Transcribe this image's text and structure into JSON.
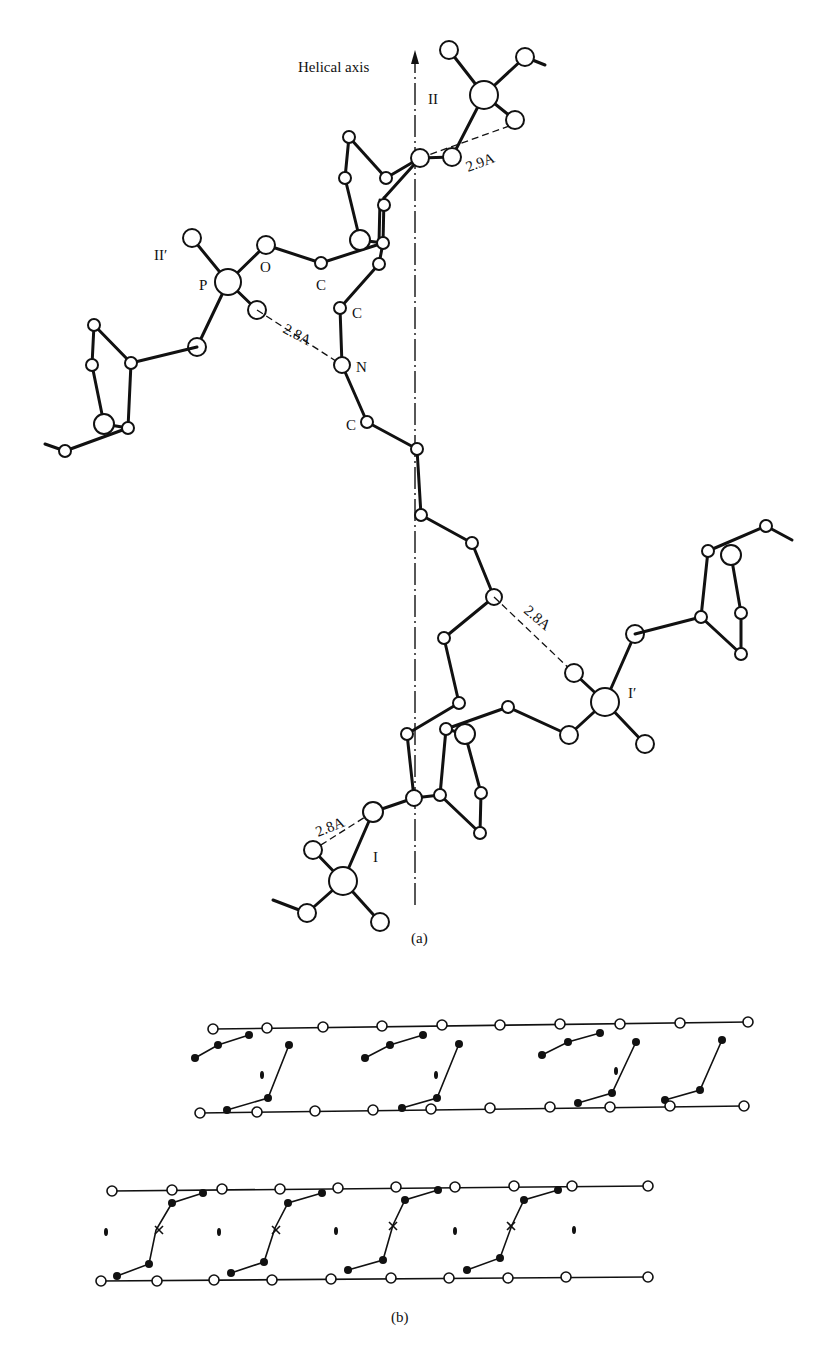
{
  "figure_a": {
    "caption": "(a)",
    "axis_label": "Helical axis",
    "labels": {
      "II": "II",
      "II_prime": "II′",
      "I": "I",
      "I_prime": "I′",
      "P": "P",
      "O": "O",
      "C1": "C",
      "C2": "C",
      "N": "N",
      "C3": "C"
    },
    "distances": {
      "top": "2.9A",
      "upper_left": "2.8A",
      "middle_right": "2.8A",
      "bottom_left": "2.8A"
    }
  },
  "figure_b": {
    "caption": "(b)"
  }
}
